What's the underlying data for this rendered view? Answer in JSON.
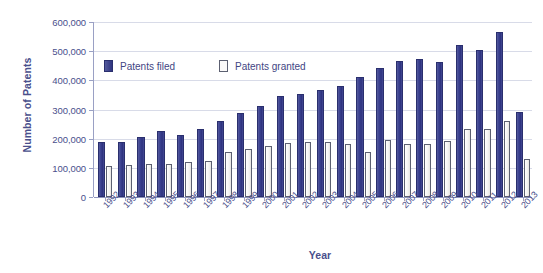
{
  "chart_data": {
    "type": "bar",
    "title": "",
    "xlabel": "Year",
    "ylabel": "Number of Patents",
    "ylim": [
      0,
      600000
    ],
    "ytick_labels": [
      "600,000",
      "500,000",
      "400,000",
      "300,000",
      "200,000",
      "100,000",
      "0"
    ],
    "ytick_values": [
      600000,
      500000,
      400000,
      300000,
      200000,
      100000,
      0
    ],
    "grid": true,
    "legend_position": "upper-left-inside",
    "categories": [
      "1992",
      "1993",
      "1994",
      "1995",
      "1996",
      "1997",
      "1998",
      "1999",
      "2000",
      "2001",
      "2002",
      "2003",
      "2004",
      "2005",
      "2006",
      "2007",
      "2008",
      "2009",
      "2010",
      "2011",
      "2012",
      "2013"
    ],
    "series": [
      {
        "name": "Patents filed",
        "color": "#3b4191",
        "values": [
          187000,
          189000,
          206000,
          228000,
          211000,
          233000,
          261000,
          289000,
          312000,
          345000,
          354000,
          367000,
          382000,
          410000,
          441000,
          468000,
          472000,
          463000,
          521000,
          504000,
          565000,
          290000
        ]
      },
      {
        "name": "Patents granted",
        "color": "#f2f0ee",
        "values": [
          108000,
          110000,
          113000,
          114000,
          121000,
          124000,
          155000,
          165000,
          176000,
          184000,
          187000,
          188000,
          182000,
          155000,
          196000,
          182000,
          181000,
          191000,
          232000,
          232000,
          262000,
          131000
        ]
      }
    ]
  },
  "legend": {
    "items": [
      {
        "label": "Patents filed",
        "swatch": "filled-square-icon"
      },
      {
        "label": "Patents granted",
        "swatch": "open-square-icon"
      }
    ]
  },
  "axes": {
    "y_title": "Number of Patents",
    "x_title": "Year"
  }
}
